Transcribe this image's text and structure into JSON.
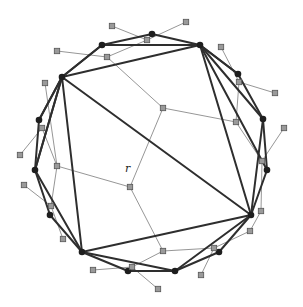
{
  "figure": {
    "root_label": "r",
    "colors": {
      "polygon_edges": "#2e2e2e",
      "tree_edges": "#8a8a8a",
      "vertices": "#1e1e1e",
      "tree_nodes": "#9a9a9a"
    }
  },
  "polygon_vertices": [
    [
      102,
      45
    ],
    [
      152,
      34
    ],
    [
      200,
      45
    ],
    [
      238,
      74
    ],
    [
      263,
      119
    ],
    [
      267,
      170
    ],
    [
      251,
      215
    ],
    [
      219,
      252
    ],
    [
      175,
      271
    ],
    [
      128,
      271
    ],
    [
      82,
      252
    ],
    [
      50,
      215
    ],
    [
      35,
      170
    ],
    [
      39,
      120
    ],
    [
      62,
      77
    ]
  ],
  "diagonals": [
    [
      0,
      2
    ],
    [
      2,
      14
    ],
    [
      2,
      4
    ],
    [
      2,
      5
    ],
    [
      4,
      6
    ],
    [
      2,
      6
    ],
    [
      14,
      6
    ],
    [
      6,
      10
    ],
    [
      6,
      8
    ],
    [
      14,
      10
    ],
    [
      14,
      12
    ],
    [
      12,
      10
    ],
    [
      10,
      8
    ],
    [
      0,
      14
    ],
    [
      3,
      2
    ],
    [
      12,
      14
    ],
    [
      13,
      14
    ]
  ],
  "tree_nodes": [
    [
      112,
      26
    ],
    [
      186,
      22
    ],
    [
      147,
      40
    ],
    [
      107,
      57
    ],
    [
      57,
      51
    ],
    [
      221,
      47
    ],
    [
      239,
      82
    ],
    [
      275,
      93
    ],
    [
      236,
      122
    ],
    [
      284,
      128
    ],
    [
      262,
      161
    ],
    [
      261,
      211
    ],
    [
      250,
      231
    ],
    [
      214,
      248
    ],
    [
      163,
      251
    ],
    [
      132,
      267
    ],
    [
      93,
      270
    ],
    [
      158,
      289
    ],
    [
      201,
      275
    ],
    [
      45,
      83
    ],
    [
      42,
      128
    ],
    [
      20,
      155
    ],
    [
      57,
      166
    ],
    [
      24,
      185
    ],
    [
      51,
      206
    ],
    [
      63,
      239
    ],
    [
      163,
      108
    ],
    [
      130,
      187
    ]
  ],
  "tree_edges": [
    [
      0,
      2
    ],
    [
      1,
      2
    ],
    [
      2,
      3
    ],
    [
      3,
      4
    ],
    [
      3,
      26
    ],
    [
      5,
      6
    ],
    [
      6,
      7
    ],
    [
      6,
      8
    ],
    [
      8,
      26
    ],
    [
      8,
      10
    ],
    [
      9,
      10
    ],
    [
      10,
      11
    ],
    [
      11,
      12
    ],
    [
      12,
      13
    ],
    [
      13,
      18
    ],
    [
      13,
      14
    ],
    [
      14,
      27
    ],
    [
      14,
      15
    ],
    [
      15,
      16
    ],
    [
      15,
      17
    ],
    [
      26,
      27
    ],
    [
      27,
      22
    ],
    [
      22,
      19
    ],
    [
      22,
      20
    ],
    [
      20,
      21
    ],
    [
      22,
      24
    ],
    [
      24,
      23
    ],
    [
      24,
      25
    ]
  ],
  "root_label_pos": [
    125,
    172
  ]
}
